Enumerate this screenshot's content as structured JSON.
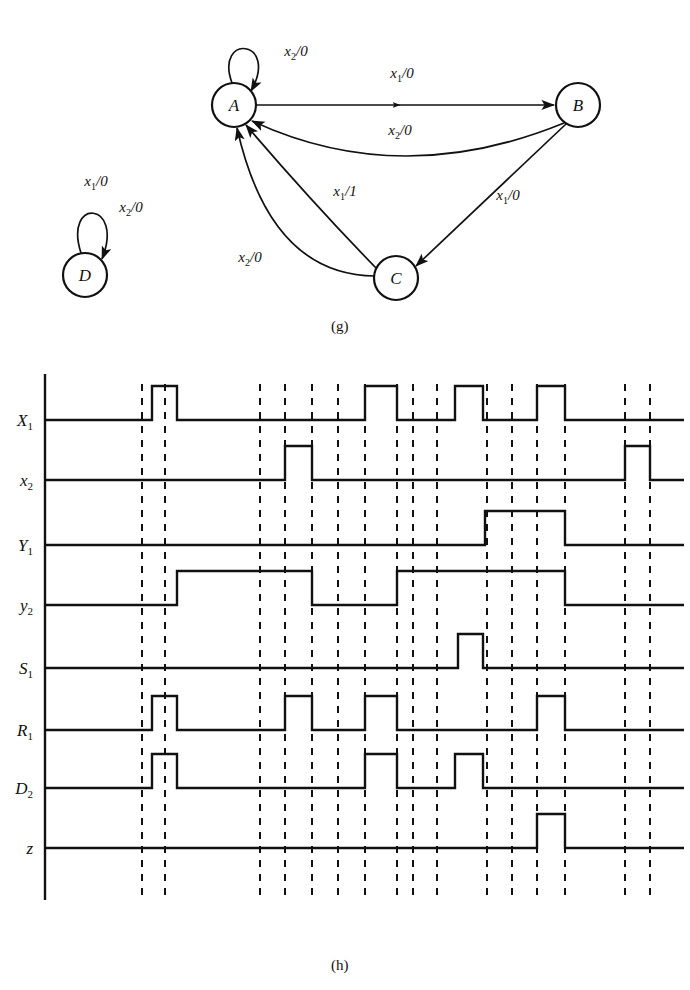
{
  "figure": {
    "parts": [
      {
        "caption": "(g)",
        "type": "state-transition-diagram"
      },
      {
        "caption": "(h)",
        "type": "timing-diagram"
      }
    ]
  },
  "state_diagram": {
    "caption": "(g)",
    "nodes": [
      {
        "id": "A",
        "label": "A",
        "cx": 234,
        "cy": 105,
        "r": 22
      },
      {
        "id": "B",
        "label": "B",
        "cx": 578,
        "cy": 105,
        "r": 22
      },
      {
        "id": "C",
        "label": "C",
        "cx": 396,
        "cy": 278,
        "r": 22
      },
      {
        "id": "D",
        "label": "D",
        "cx": 85,
        "cy": 275,
        "r": 22
      }
    ],
    "edges": [
      {
        "from": "A",
        "to": "A",
        "label": "x_2/0",
        "label_x": 296,
        "label_y": 56
      },
      {
        "from": "A",
        "to": "B",
        "label": "x_1/0",
        "label_x": 402,
        "label_y": 78
      },
      {
        "from": "B",
        "to": "A",
        "label": "x_2/0",
        "label_x": 400,
        "label_y": 135
      },
      {
        "from": "B",
        "to": "C",
        "label": "x_1/0",
        "label_x": 508,
        "label_y": 200
      },
      {
        "from": "C",
        "to": "A",
        "label": "x_1/1",
        "label_x": 345,
        "label_y": 196
      },
      {
        "from": "C",
        "to": "A",
        "label": "x_2/0",
        "label_x": 250,
        "label_y": 262
      },
      {
        "from": "D",
        "to": "D",
        "label": "x_1/0",
        "label_x": 96,
        "label_y": 186
      },
      {
        "from": "D",
        "to": "D",
        "label": "x_2/0",
        "label_x": 131,
        "label_y": 212
      }
    ]
  },
  "chart_data": {
    "type": "line",
    "title": "(h)",
    "xlabel": "",
    "ylabel": "",
    "axis": {
      "x_start": 45,
      "x_end": 684,
      "grid": "dashed-vertical"
    },
    "dashed_lines_x": [
      142,
      165,
      260,
      285,
      312,
      338,
      365,
      397,
      413,
      437,
      487,
      512,
      537,
      565,
      625,
      650
    ],
    "signal_order": [
      "X1",
      "x2",
      "Y1",
      "y2",
      "S1",
      "R1",
      "D2",
      "z"
    ],
    "signals": [
      {
        "name": "X1",
        "label": "X",
        "sub": "1",
        "baseline_y": 420,
        "amplitude": 34,
        "pulses": [
          [
            152,
            177
          ],
          [
            365,
            397
          ],
          [
            455,
            483
          ],
          [
            537,
            565
          ]
        ]
      },
      {
        "name": "x2",
        "label": "x",
        "sub": "2",
        "baseline_y": 480,
        "amplitude": 34,
        "pulses": [
          [
            285,
            312
          ],
          [
            625,
            650
          ]
        ]
      },
      {
        "name": "Y1",
        "label": "Y",
        "sub": "1",
        "baseline_y": 545,
        "amplitude": 34,
        "pulses": [
          [
            485,
            565
          ]
        ]
      },
      {
        "name": "y2",
        "label": "y",
        "sub": "2",
        "baseline_y": 605,
        "amplitude": 34,
        "pulses": [
          [
            177,
            312
          ],
          [
            397,
            565
          ]
        ]
      },
      {
        "name": "S1",
        "label": "S",
        "sub": "1",
        "baseline_y": 668,
        "amplitude": 34,
        "pulses": [
          [
            458,
            483
          ]
        ]
      },
      {
        "name": "R1",
        "label": "R",
        "sub": "1",
        "baseline_y": 730,
        "amplitude": 34,
        "pulses": [
          [
            152,
            177
          ],
          [
            285,
            312
          ],
          [
            365,
            397
          ],
          [
            537,
            565
          ]
        ]
      },
      {
        "name": "D2",
        "label": "D",
        "sub": "2",
        "baseline_y": 788,
        "amplitude": 34,
        "pulses": [
          [
            152,
            177
          ],
          [
            365,
            397
          ],
          [
            455,
            483
          ]
        ]
      },
      {
        "name": "z",
        "label": "z",
        "sub": "",
        "baseline_y": 848,
        "amplitude": 34,
        "pulses": [
          [
            537,
            565
          ]
        ]
      }
    ]
  }
}
